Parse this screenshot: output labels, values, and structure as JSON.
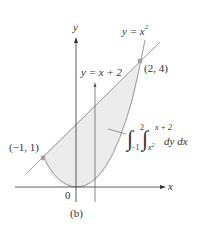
{
  "diagram": {
    "type": "double-integral-region",
    "caption": "(b)",
    "axes": {
      "x_label": "x",
      "y_label": "y",
      "origin_label": "0"
    },
    "curves": [
      {
        "name": "parabola",
        "label": "y = x",
        "exponent": "2"
      },
      {
        "name": "line",
        "label": "y = x + 2"
      }
    ],
    "points": [
      {
        "label": "(2, 4)",
        "x": 2,
        "y": 4
      },
      {
        "label": "(−1, 1)",
        "x": -1,
        "y": 1
      }
    ],
    "integral": {
      "outer_lower": "−1",
      "outer_upper": "2",
      "inner_lower": "x",
      "inner_lower_exp": "2",
      "inner_upper": "x + 2",
      "integrand": "dy dx"
    },
    "colors": {
      "region_fill": "#ececec",
      "curve_stroke": "#9a9a9a",
      "axis_stroke": "#333333",
      "point_fill": "#a0a0a0"
    }
  }
}
